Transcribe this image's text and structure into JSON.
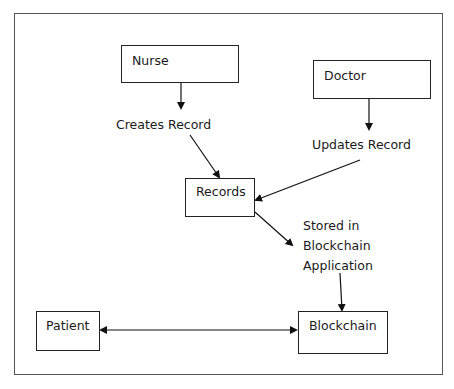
{
  "diagram": {
    "nodes": {
      "nurse": "Nurse",
      "doctor": "Doctor",
      "records": "Records",
      "patient": "Patient",
      "blockchain": "Blockchain"
    },
    "edge_labels": {
      "creates": "Creates Record",
      "updates": "Updates Record",
      "stored_line1": "Stored in",
      "stored_line2": "Blockchain",
      "stored_line3": "Application"
    },
    "edges": [
      {
        "from": "nurse",
        "to": "records",
        "label": "Creates Record"
      },
      {
        "from": "doctor",
        "to": "records",
        "label": "Updates Record"
      },
      {
        "from": "records",
        "to": "blockchain",
        "label": "Stored in Blockchain Application"
      },
      {
        "from": "patient",
        "to": "blockchain",
        "bidirectional": true
      }
    ]
  }
}
